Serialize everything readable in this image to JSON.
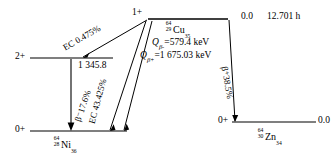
{
  "diagram": {
    "parent": {
      "spin_parity": "1+",
      "nuclide_mass": "64",
      "nuclide_atomic_number": "29",
      "nuclide_symbol": "Cu",
      "nuclide_neutron_number": "35",
      "energy": "0.0",
      "half_life": "12.701 h",
      "q_beta_minus_label": "Q",
      "q_beta_minus_sub": "β-",
      "q_beta_minus_value": "=579.4 keV",
      "q_beta_plus_label": "Q",
      "q_beta_plus_sub": "β+",
      "q_beta_plus_value": "=1 675.03 keV"
    },
    "left_daughter": {
      "nuclide_mass": "64",
      "nuclide_atomic_number": "28",
      "nuclide_symbol": "Ni",
      "nuclide_neutron_number": "36",
      "excited_level": {
        "spin_parity": "2+",
        "energy": "1 345.8"
      },
      "ground_level": {
        "spin_parity": "0+"
      }
    },
    "right_daughter": {
      "nuclide_mass": "64",
      "nuclide_atomic_number": "30",
      "nuclide_symbol": "Zn",
      "nuclide_neutron_number": "34",
      "ground_level": {
        "spin_parity": "0+",
        "energy": "0.0"
      }
    },
    "transitions": [
      {
        "name": "ec-to-excited",
        "label": "EC 0.475%",
        "mode": "EC",
        "intensity_percent": "0.475"
      },
      {
        "name": "beta-minus-to-ground",
        "label": "β⁻17.6%",
        "mode": "β-",
        "intensity_percent": "17.6"
      },
      {
        "name": "ec-to-ground",
        "label": "EC 43.425%",
        "mode": "EC",
        "intensity_percent": "43.425"
      },
      {
        "name": "beta-plus-to-zn",
        "label": "β⁺38.5%",
        "mode": "β+",
        "intensity_percent": "38.5"
      },
      {
        "name": "gamma-transition",
        "label": ""
      }
    ]
  },
  "colors": {
    "line": "#000000",
    "background": "#ffffff"
  }
}
